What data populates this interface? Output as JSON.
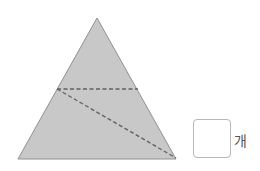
{
  "figure": {
    "shape": "triangle",
    "fill": "#c8c8c8",
    "stroke": "#909090",
    "dash_color": "#606060",
    "vertices": {
      "apex": [
        97,
        18
      ],
      "base_left": [
        18,
        159
      ],
      "base_right": [
        176,
        159
      ]
    },
    "dashed_lines": [
      {
        "from": [
          57,
          89
        ],
        "to": [
          138,
          89
        ]
      },
      {
        "from": [
          57,
          89
        ],
        "to": [
          176,
          158
        ]
      }
    ]
  },
  "answer": {
    "value": "",
    "unit": "개"
  }
}
